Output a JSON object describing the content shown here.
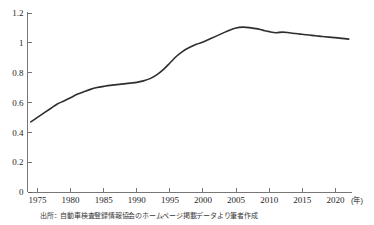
{
  "figure": {
    "source_note": "出所：自動車検査登録情報協会のホームページ掲載データより筆者作成"
  },
  "chart_data": {
    "type": "line",
    "title": "",
    "subtitle": "",
    "xlabel": "",
    "ylabel": "",
    "x_unit_label": "(年)",
    "grid": false,
    "legend": "none",
    "xlim": [
      1973.5,
      2022.5
    ],
    "ylim": [
      0,
      1.2
    ],
    "x_ticks": [
      1975,
      1980,
      1985,
      1990,
      1995,
      2000,
      2005,
      2010,
      2015,
      2020
    ],
    "x_tick_labels": [
      "1975",
      "1980",
      "1985",
      "1990",
      "1995",
      "2000",
      "2005",
      "2010",
      "2015",
      "2020"
    ],
    "y_ticks": [
      0,
      0.2,
      0.4,
      0.6,
      0.8,
      1,
      1.2
    ],
    "y_tick_labels": [
      "0",
      "0.2",
      "0.4",
      "0.6",
      "0.8",
      "1",
      "1.2"
    ],
    "line_color": "#2e2e2e",
    "series": [
      {
        "name": "一世帯当たり自動車保有台数",
        "x": [
          1974,
          1975,
          1976,
          1977,
          1978,
          1979,
          1980,
          1981,
          1982,
          1983,
          1984,
          1985,
          1986,
          1987,
          1988,
          1989,
          1990,
          1991,
          1992,
          1993,
          1994,
          1995,
          1996,
          1997,
          1998,
          1999,
          2000,
          2001,
          2002,
          2003,
          2004,
          2005,
          2006,
          2007,
          2008,
          2009,
          2010,
          2011,
          2012,
          2013,
          2014,
          2015,
          2016,
          2017,
          2018,
          2019,
          2020,
          2021,
          2022
        ],
        "values": [
          0.47,
          0.5,
          0.53,
          0.56,
          0.59,
          0.61,
          0.632,
          0.655,
          0.672,
          0.688,
          0.7,
          0.708,
          0.715,
          0.72,
          0.725,
          0.73,
          0.735,
          0.745,
          0.76,
          0.785,
          0.82,
          0.865,
          0.91,
          0.945,
          0.97,
          0.99,
          1.005,
          1.025,
          1.045,
          1.065,
          1.085,
          1.1,
          1.105,
          1.102,
          1.095,
          1.085,
          1.075,
          1.068,
          1.072,
          1.068,
          1.062,
          1.057,
          1.052,
          1.048,
          1.042,
          1.038,
          1.035,
          1.03,
          1.025
        ]
      }
    ]
  }
}
